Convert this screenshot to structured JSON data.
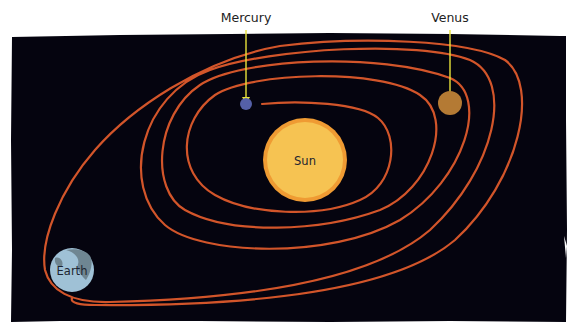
{
  "diagram": {
    "colors": {
      "space": "#05040f",
      "orbit": "#d2552a",
      "pointer": "#e8e23a",
      "sun_fill": "#f6c352",
      "sun_rim": "#ef9b33",
      "mercury": "#5560a8",
      "venus": "#b47a34",
      "earth": "#9fc1d6",
      "earth_land": "#6f8692"
    },
    "bodies": {
      "sun": {
        "label": "Sun"
      },
      "mercury": {
        "label": "Mercury"
      },
      "venus": {
        "label": "Venus"
      },
      "earth": {
        "label": "Earth"
      }
    },
    "orbit": {
      "description": "Spiral path winding outward from Mercury past Venus to Earth",
      "loops": 4
    }
  }
}
